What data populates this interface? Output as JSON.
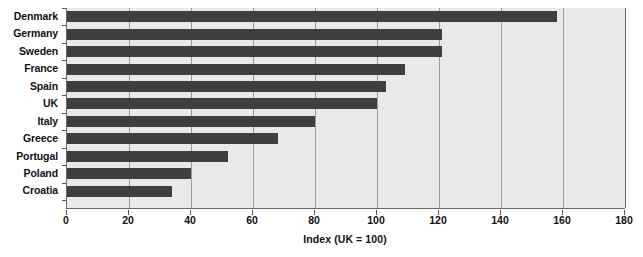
{
  "chart_data": {
    "type": "bar",
    "orientation": "horizontal",
    "title": "",
    "subtitle": "",
    "xlabel": "Index (UK = 100)",
    "ylabel": "",
    "xlim": [
      0,
      180
    ],
    "xticks": [
      0,
      20,
      40,
      60,
      80,
      100,
      120,
      140,
      160,
      180
    ],
    "grid": true,
    "legend": null,
    "categories": [
      "Denmark",
      "Germany",
      "Sweden",
      "France",
      "Spain",
      "UK",
      "Italy",
      "Greece",
      "Portugal",
      "Poland",
      "Croatia"
    ],
    "values": [
      158,
      121,
      121,
      109,
      103,
      100,
      80,
      68,
      52,
      40,
      34
    ],
    "series": [
      {
        "name": "Index (UK = 100)",
        "values": [
          158,
          121,
          121,
          109,
          103,
          100,
          80,
          68,
          52,
          40,
          34
        ]
      }
    ],
    "colors": {
      "bar": "#3f3f3f",
      "plot_background": "#e9e9e9",
      "gridline": "#9b9b9b",
      "axis": "#6a6a6a",
      "text": "#111111",
      "page_background": "#ffffff"
    }
  }
}
